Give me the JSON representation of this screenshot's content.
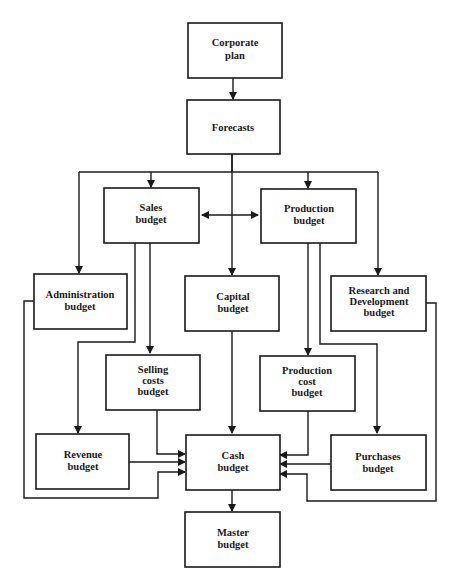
{
  "nodes": {
    "corporate_plan": {
      "lines": [
        "Corporate",
        "plan"
      ]
    },
    "forecasts": {
      "lines": [
        "Forecasts"
      ]
    },
    "sales_budget": {
      "lines": [
        "Sales",
        "budget"
      ]
    },
    "production_budget": {
      "lines": [
        "Production",
        "budget"
      ]
    },
    "administration_budget": {
      "lines": [
        "Administration",
        "budget"
      ]
    },
    "capital_budget": {
      "lines": [
        "Capital",
        "budget"
      ]
    },
    "rnd_budget": {
      "lines": [
        "Research and",
        "Development",
        "budget"
      ]
    },
    "selling_costs_budget": {
      "lines": [
        "Selling",
        "costs",
        "budget"
      ]
    },
    "production_cost_budget": {
      "lines": [
        "Production",
        "cost",
        "budget"
      ]
    },
    "revenue_budget": {
      "lines": [
        "Revenue",
        "budget"
      ]
    },
    "cash_budget": {
      "lines": [
        "Cash",
        "budget"
      ]
    },
    "purchases_budget": {
      "lines": [
        "Purchases",
        "budget"
      ]
    },
    "master_budget": {
      "lines": [
        "Master",
        "budget"
      ]
    }
  },
  "edges": [
    [
      "corporate_plan",
      "forecasts"
    ],
    [
      "forecasts",
      "sales_budget"
    ],
    [
      "forecasts",
      "production_budget"
    ],
    [
      "forecasts",
      "administration_budget"
    ],
    [
      "forecasts",
      "capital_budget"
    ],
    [
      "forecasts",
      "rnd_budget"
    ],
    [
      "sales_budget",
      "production_budget",
      "bidirectional"
    ],
    [
      "sales_budget",
      "selling_costs_budget"
    ],
    [
      "sales_budget",
      "revenue_budget"
    ],
    [
      "production_budget",
      "production_cost_budget"
    ],
    [
      "production_budget",
      "purchases_budget"
    ],
    [
      "administration_budget",
      "cash_budget"
    ],
    [
      "selling_costs_budget",
      "cash_budget"
    ],
    [
      "revenue_budget",
      "cash_budget"
    ],
    [
      "capital_budget",
      "cash_budget"
    ],
    [
      "production_cost_budget",
      "cash_budget"
    ],
    [
      "purchases_budget",
      "cash_budget"
    ],
    [
      "rnd_budget",
      "cash_budget"
    ],
    [
      "cash_budget",
      "master_budget"
    ]
  ]
}
